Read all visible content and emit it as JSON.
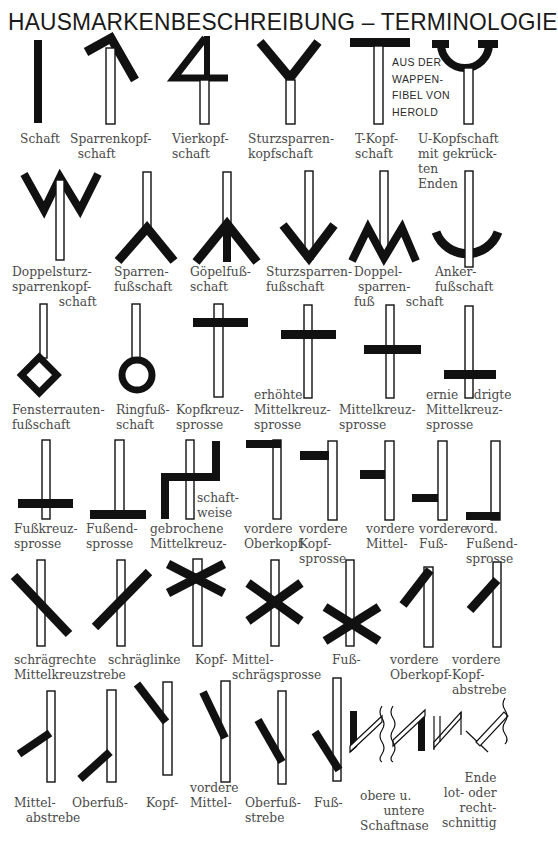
{
  "title": "HAUSMARKENBESCHREIBUNG  – TERMINOLOGIE",
  "source_note": [
    "AUS DER",
    "WAPPEN-",
    "FIBEL VON",
    "HEROLD"
  ],
  "rows": [
    {
      "row": 1,
      "labels": [
        "Schaft",
        "Sparrenkopf-\n  schaft",
        "Vierkopf-\nschaft",
        "Sturzsparren-\nkopfschaft",
        "T-Kopf-\nschaft",
        "U-Kopfschaft\nmit gekrück-\nten\nEnden"
      ]
    },
    {
      "row": 2,
      "labels": [
        "Doppelsturz-\nsparrenkopf-\n            schaft",
        "Sparren-\nfußschaft",
        "Göpelfuß-\nschaft",
        "Sturzsparren-\nfußschaft",
        "Doppel-\n sparren-\nfuß        schaft",
        "Anker-\nfußschaft"
      ]
    },
    {
      "row": 3,
      "labels": [
        "Fensterrauten-\nfußschaft",
        "Ringfuß-\nschaft",
        "Kopfkreuz-\nsprosse",
        "erhöhte\nMittelkreuz-\nsprosse",
        "Mittelkreuz-\nsprosse",
        "ernie    drigte\nMittelkreuz-\nsprosse"
      ]
    },
    {
      "row": 4,
      "labels": [
        "Fußkreuz-\nsprosse",
        "Fußend-\nsprosse",
        "gebrochene\nMittelkreuz-",
        "schaft-\nweise",
        "vordere\nOberkopf-",
        "vordere\nKopf-\nsprosse",
        "vordere\nMittel-",
        "vordere\nFuß-",
        "vord.\nFußend-\nsprosse"
      ]
    },
    {
      "row": 5,
      "labels": [
        "schrägrechte\nMittelkreuzstrebe",
        "schräglinke",
        "Kopf-",
        "Mittel-\nschrägsprosse",
        "Fuß-",
        "vordere\nOberkopf-",
        "vordere\nKopf-\nabstrebe"
      ]
    },
    {
      "row": 6,
      "labels": [
        "Mittel-\n   abstrebe",
        "Oberfuß-",
        "Kopf-",
        "vordere\nMittel-",
        "Oberfuß-\nstrebe",
        "Fuß-",
        "obere u.\n      untere\nSchaftnase",
        "Ende\nlot- oder\nrecht-\nschnittig"
      ]
    }
  ]
}
